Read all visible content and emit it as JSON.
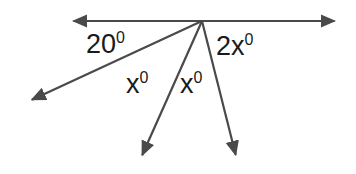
{
  "figure": {
    "type": "geometry-angle-diagram",
    "background_color": "#ffffff",
    "stroke_color": "#4a4a4a",
    "text_color": "#1a1a1a",
    "width": 356,
    "height": 174,
    "vertex": {
      "x": 202,
      "y": 21
    }
  },
  "labels": {
    "left_exterior": {
      "value": "20",
      "degree": "0"
    },
    "right_exterior": {
      "value": "2x",
      "degree": "0"
    },
    "inner_left": {
      "value": "x",
      "degree": "0"
    },
    "inner_right": {
      "value": "x",
      "degree": "0"
    }
  },
  "rays": [
    {
      "name": "horizontal-left",
      "from": {
        "x": 202,
        "y": 21
      },
      "to": {
        "x": 68,
        "y": 21
      },
      "arrow": true
    },
    {
      "name": "horizontal-right",
      "from": {
        "x": 202,
        "y": 21
      },
      "to": {
        "x": 340,
        "y": 21
      },
      "arrow": true
    },
    {
      "name": "lower-left",
      "from": {
        "x": 202,
        "y": 21
      },
      "to": {
        "x": 27,
        "y": 102
      },
      "arrow": true
    },
    {
      "name": "lower-middle",
      "from": {
        "x": 202,
        "y": 21
      },
      "to": {
        "x": 140,
        "y": 160
      },
      "arrow": true
    },
    {
      "name": "lower-right",
      "from": {
        "x": 202,
        "y": 21
      },
      "to": {
        "x": 237,
        "y": 160
      },
      "arrow": true
    }
  ]
}
